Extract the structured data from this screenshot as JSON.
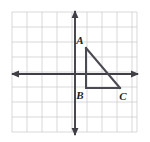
{
  "figure": {
    "background_color": "#ffffff",
    "width": 150,
    "height": 142
  },
  "grid": {
    "line_color": "#c8c8cc",
    "line_width": 0.7,
    "cell_size": 15,
    "left": 12,
    "top": 12,
    "right": 137,
    "bottom": 132,
    "columns": 8,
    "rows": 8
  },
  "axes": {
    "color": "#3f3f45",
    "line_width": 1.9,
    "origin_x": 75,
    "origin_y": 74,
    "x_axis": {
      "name": "x-axis",
      "from_x": 10,
      "to_x": 140,
      "y": 74,
      "arrows": "both"
    },
    "y_axis": {
      "name": "y-axis",
      "x": 75,
      "from_y": 10,
      "to_y": 134,
      "arrows": "both"
    }
  },
  "triangle": {
    "name": "triangle-ABC",
    "stroke_color": "#4a4a52",
    "stroke_width": 2.0,
    "fill": "none",
    "right_angle_at": "B",
    "vertices": [
      {
        "label": "A",
        "px": 86,
        "py": 48,
        "grid_x": 1,
        "grid_y": 2,
        "label_px": 80,
        "label_py": 44
      },
      {
        "label": "B",
        "px": 86,
        "py": 88,
        "grid_x": 1,
        "grid_y": -1,
        "label_px": 80,
        "label_py": 99
      },
      {
        "label": "C",
        "px": 120,
        "py": 88,
        "grid_x": 3,
        "grid_y": -1,
        "label_px": 121,
        "label_py": 100
      }
    ],
    "edges": [
      {
        "name": "edge-AB",
        "from": "A",
        "to": "B"
      },
      {
        "name": "edge-BC",
        "from": "B",
        "to": "C"
      },
      {
        "name": "edge-CA",
        "from": "C",
        "to": "A"
      }
    ]
  },
  "labels": {
    "a": "A",
    "b": "B",
    "c": "C"
  }
}
